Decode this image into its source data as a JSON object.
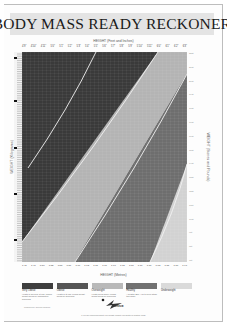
{
  "title": "BODY MASS READY RECKONER",
  "chart_data": {
    "type": "area",
    "title": "BODY MASS READY RECKONER",
    "xlabel_top": "HEIGHT (Feet and Inches)",
    "xlabel_bottom": "HEIGHT (Metres)",
    "ylabel_left": "WEIGHT (Kilograms)",
    "ylabel_right": "WEIGHT (Stones and Pounds)",
    "x_ticks_metres": [
      "1.45",
      "1.48",
      "1.50",
      "1.52",
      "1.55",
      "1.57",
      "1.60",
      "1.63",
      "1.65",
      "1.68",
      "1.70",
      "1.73",
      "1.75",
      "1.78",
      "1.80",
      "1.83",
      "1.85",
      "1.88",
      "1.91"
    ],
    "x_ticks_feet": [
      "4'9\"",
      "4'10\"",
      "4'11\"",
      "5'0\"",
      "5'1\"",
      "5'2\"",
      "5'3\"",
      "5'4\"",
      "5'5\"",
      "5'6\"",
      "5'7\"",
      "5'8\"",
      "5'9\"",
      "5'10\"",
      "5'11\"",
      "6'0\"",
      "6'1\"",
      "6'2\"",
      "6'3\""
    ],
    "y_ticks_stones": [
      "22st",
      "21st",
      "20st",
      "19st",
      "18st",
      "17st",
      "16st",
      "15st",
      "14st",
      "13st",
      "12st",
      "11st",
      "10st",
      "9st",
      "8st",
      "7st"
    ],
    "grid": true,
    "bands": [
      {
        "name": "Very Obese",
        "color": "#3a3a3a",
        "bmi_range": "40+"
      },
      {
        "name": "Obese",
        "color": "#525252",
        "bmi_range": "30-40"
      },
      {
        "name": "Overweight",
        "color": "#b4b4b4",
        "bmi_range": "25-30"
      },
      {
        "name": "Healthy",
        "color": "#6e6e6e",
        "bmi_range": "18.5-25"
      },
      {
        "name": "Underweight",
        "color": "#d2d2d2",
        "bmi_range": "<18.5"
      }
    ],
    "boundaries_px": {
      "very_obese_line": [
        [
          74,
          0
        ],
        [
          6,
          116
        ]
      ],
      "obese_overweight": [
        [
          136,
          0
        ],
        [
          0,
          190
        ]
      ],
      "overweight_healthy": [
        [
          165,
          22
        ],
        [
          53,
          210
        ]
      ],
      "healthy_underweight": [
        [
          165,
          112
        ],
        [
          128,
          210
        ]
      ]
    },
    "legend_position": "bottom"
  },
  "legend": [
    {
      "label": "Very Obese",
      "desc": "Health is severely at risk. Losing weight would be immediately beneficial",
      "color": "#3e3e3e"
    },
    {
      "label": "Obese",
      "desc": "Health is at risk. Losing weight would be beneficial",
      "color": "#555555"
    },
    {
      "label": "Overweight",
      "desc": "Health could suffer. Losing weight would be beneficial",
      "color": "#b9b9b9"
    },
    {
      "label": "Healthy",
      "desc": "A healthy BMI. Aim to keep within this range",
      "color": "#717171"
    },
    {
      "label": "Underweight",
      "desc": "",
      "color": "#dadada"
    }
  ],
  "logo": {
    "text": "Zeneca"
  },
  "publisher": "Produced by Zeneca Pharma",
  "footer": "If you are concerned about your weight, consult your doctor or practice nurse"
}
